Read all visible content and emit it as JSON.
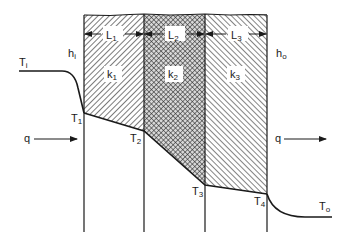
{
  "diagram": {
    "colors": {
      "ink": "#1a1a1a",
      "background": "#ffffff"
    },
    "walls": {
      "x": [
        84,
        144,
        205,
        267
      ],
      "top_y": 15,
      "bottom_y": 232
    },
    "layers": [
      {
        "id": "layer-1",
        "length_label": "L",
        "length_sub": "1",
        "k_label": "k",
        "k_sub": "1",
        "hatch": "diagonal-forward"
      },
      {
        "id": "layer-2",
        "length_label": "L",
        "length_sub": "2",
        "k_label": "k",
        "k_sub": "2",
        "hatch": "cross-hatch"
      },
      {
        "id": "layer-3",
        "length_label": "L",
        "length_sub": "3",
        "k_label": "k",
        "k_sub": "3",
        "hatch": "diagonal-back"
      }
    ],
    "convection": {
      "inside": {
        "label": "h",
        "sub": "i"
      },
      "outside": {
        "label": "h",
        "sub": "o"
      }
    },
    "heat_flow": {
      "left": {
        "label": "q"
      },
      "right": {
        "label": "q"
      }
    },
    "temperatures": {
      "Ti": {
        "label": "T",
        "sub": "i"
      },
      "T1": {
        "label": "T",
        "sub": "1"
      },
      "T2": {
        "label": "T",
        "sub": "2"
      },
      "T3": {
        "label": "T",
        "sub": "3"
      },
      "T4": {
        "label": "T",
        "sub": "4"
      },
      "To": {
        "label": "T",
        "sub": "o"
      }
    },
    "profile_points": {
      "Ti_y": 71,
      "T1_y": 113,
      "T2_y": 131,
      "T3_y": 185,
      "T4_y": 194,
      "To_y": 217
    }
  }
}
